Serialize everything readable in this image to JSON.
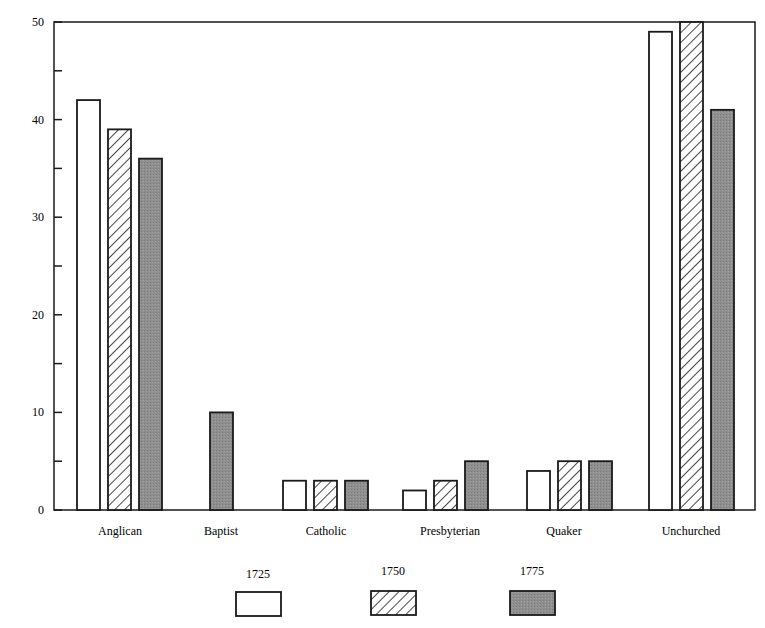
{
  "chart_data": {
    "type": "bar",
    "title": "",
    "xlabel": "",
    "ylabel": "",
    "ylim": [
      0,
      50
    ],
    "yticks": [
      0,
      10,
      20,
      30,
      40,
      50
    ],
    "minor_yticks": [
      5,
      15,
      25,
      35,
      45
    ],
    "grid": false,
    "legend_position": "bottom",
    "categories": [
      "Anglican",
      "Baptist",
      "Catholic",
      "Presbyterian",
      "Quaker",
      "Unchurched"
    ],
    "series": [
      {
        "name": "1725",
        "pattern": "white",
        "values": [
          42,
          0,
          3,
          2,
          4,
          49
        ]
      },
      {
        "name": "1750",
        "pattern": "hatched",
        "values": [
          39,
          0,
          3,
          3,
          5,
          50
        ]
      },
      {
        "name": "1775",
        "pattern": "gray",
        "values": [
          36,
          10,
          3,
          5,
          5,
          41
        ]
      }
    ]
  },
  "colors": {
    "axis": "#1a1a1a",
    "bar_white": "#ffffff",
    "bar_gray": "#8c8c8c",
    "hatch": "#1a1a1a"
  }
}
